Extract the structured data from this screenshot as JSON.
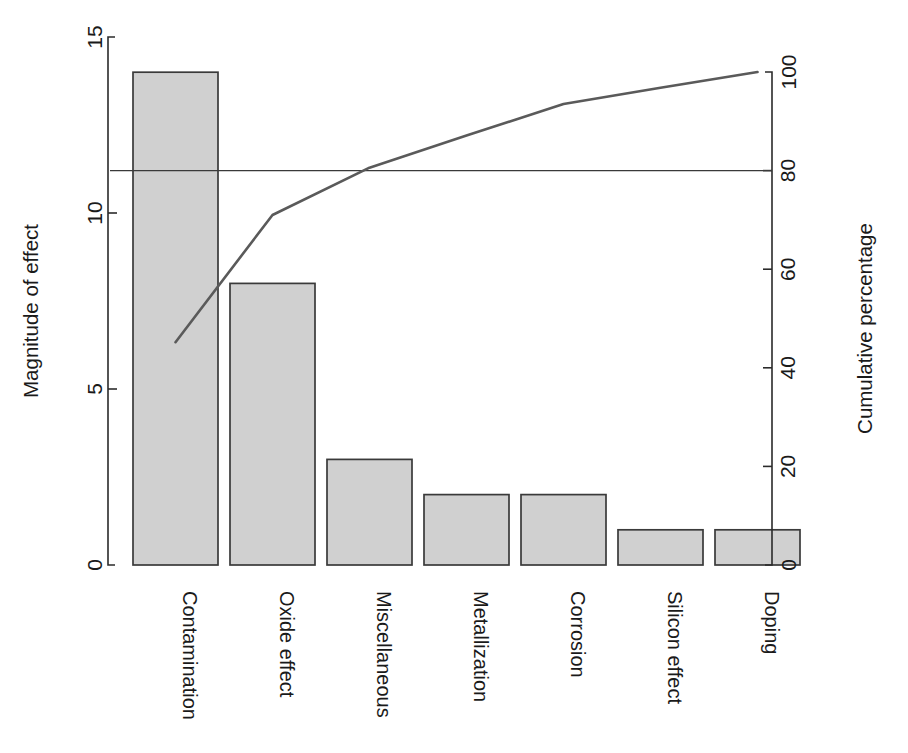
{
  "chart_data": {
    "type": "bar",
    "title": "",
    "subtitle": "",
    "categories": [
      "Contamination",
      "Oxide effect",
      "Miscellaneous",
      "Metallization",
      "Corrosion",
      "Silicon effect",
      "Doping"
    ],
    "values": [
      14,
      8,
      3,
      2,
      2,
      1,
      1
    ],
    "series": [
      {
        "name": "Magnitude of effect",
        "type": "bar",
        "values": [
          14,
          8,
          3,
          2,
          2,
          1,
          1
        ]
      },
      {
        "name": "Cumulative percentage",
        "type": "line",
        "values": [
          45.2,
          71.0,
          80.6,
          87.1,
          93.5,
          96.8,
          100.0
        ]
      }
    ],
    "xlabel": "",
    "ylabel": "Magnitude of effect",
    "y2label": "Cumulative percentage",
    "ylim": [
      0,
      15
    ],
    "y2lim": [
      0,
      100
    ],
    "yticks": [
      "0",
      "5",
      "10",
      "15"
    ],
    "ytick_values": [
      0,
      5,
      10,
      15
    ],
    "y2ticks": [
      "0",
      "20",
      "40",
      "60",
      "80",
      "100"
    ],
    "y2tick_values": [
      0,
      20,
      40,
      60,
      80,
      100
    ],
    "grid": false,
    "legend": "none",
    "annotations": [
      {
        "name": "eighty-percent-reference-line",
        "type": "horizontal-line",
        "value": 80,
        "axis": "y2"
      }
    ],
    "total": 31,
    "colors": {
      "bar_fill": "#d0d0d0",
      "bar_stroke": "#3a3a3a",
      "line": "#5a5a5a",
      "axis": "#2b2b2b",
      "background": "#ffffff"
    }
  },
  "axes": {
    "left": {
      "title": "Magnitude of effect",
      "ticks": [
        "0",
        "5",
        "10",
        "15"
      ]
    },
    "right": {
      "title": "Cumulative percentage",
      "ticks": [
        "0",
        "20",
        "40",
        "60",
        "80",
        "100"
      ]
    },
    "bottom": {
      "categories": [
        "Contamination",
        "Oxide effect",
        "Miscellaneous",
        "Metallization",
        "Corrosion",
        "Silicon effect",
        "Doping"
      ]
    }
  }
}
